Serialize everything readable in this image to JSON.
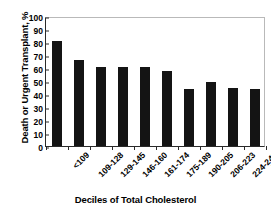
{
  "chart_data": {
    "type": "bar",
    "title": "",
    "xlabel": "Deciles of Total Cholesterol",
    "ylabel": "Death or Urgent Transplant, %",
    "categories": [
      "<109",
      "109-128",
      "129-145",
      "146-160",
      "161-174",
      "175-189",
      "190-205",
      "206-223",
      "224-249",
      ">250"
    ],
    "values": [
      81,
      66,
      61,
      60.5,
      60.5,
      58,
      44,
      49.5,
      45,
      43.5
    ],
    "series": [
      {
        "name": "Death or Urgent Transplant",
        "values": [
          81,
          66,
          61,
          60.5,
          60.5,
          58,
          44,
          49.5,
          45,
          43.5
        ]
      }
    ],
    "ylim": [
      0,
      100
    ],
    "y_ticks": [
      0,
      10,
      20,
      30,
      40,
      50,
      60,
      70,
      80,
      90,
      100
    ],
    "y_tick_labels": [
      "0",
      "10",
      "20",
      "30",
      "40",
      "50",
      "60",
      "70",
      "80",
      "90",
      "100"
    ],
    "grid": false,
    "legend": false,
    "legend_position": "none",
    "bar_color": "#141414",
    "axis_color": "#2a2a2a",
    "frame_color": "#b9b9b9",
    "background_color": "#ffffff"
  }
}
